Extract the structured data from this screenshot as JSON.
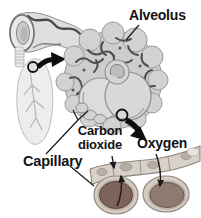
{
  "diagram": {
    "labels": {
      "alveolus": "Alveolus",
      "carbon_dioxide": "Carbon dioxide",
      "oxygen": "Oxygen",
      "capillary": "Capillary"
    },
    "icons": {
      "lung_zoom_arrow": "thick-black-curved-arrow",
      "alveolus_zoom_arrow": "thick-black-curved-arrow",
      "magnifier_circles": "small-black-outline-circle",
      "gas_flow_arrows": "thin-curved-arrow"
    },
    "colors": {
      "background": "#ffffff",
      "label_text": "#121212",
      "line_art_dark": "#4f4f4f",
      "arrow_black": "#0d0d0d",
      "alveolus_fill": "#cdcdcd",
      "alveolus_outline": "#9a9a9a",
      "bronchiole_fill": "#dedede",
      "lung_fill": "#ededed",
      "capillary_wall": "#d7d1ca",
      "cell_ring": "#d4cbc3",
      "red_blood_cell_left": "#7e635c",
      "red_blood_cell_right": "#8f7a71"
    }
  }
}
